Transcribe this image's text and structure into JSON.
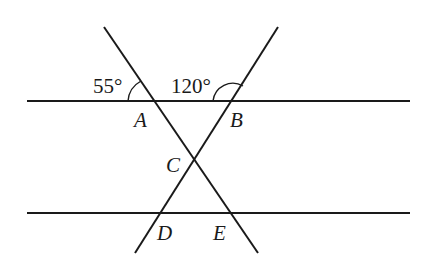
{
  "diagram": {
    "type": "geometry",
    "colors": {
      "stroke": "#1a1a1a",
      "background": "#ffffff"
    },
    "lines": {
      "top_parallel": {
        "x1": 27,
        "y1": 101,
        "x2": 410,
        "y2": 101
      },
      "bottom_parallel": {
        "x1": 27,
        "y1": 213,
        "x2": 410,
        "y2": 213
      },
      "transversal_AE": {
        "x1": 104,
        "y1": 27,
        "x2": 258,
        "y2": 253
      },
      "transversal_BD": {
        "x1": 278,
        "y1": 27,
        "x2": 135,
        "y2": 253
      }
    },
    "points": {
      "A": {
        "label": "A",
        "x": 153,
        "y": 101
      },
      "B": {
        "label": "B",
        "x": 233,
        "y": 101
      },
      "C": {
        "label": "C",
        "x": 194,
        "y": 160
      },
      "D": {
        "label": "D",
        "x": 158,
        "y": 213
      },
      "E": {
        "label": "E",
        "x": 231,
        "y": 213
      }
    },
    "angles": {
      "angle_at_A": {
        "label": "55°",
        "value": 55
      },
      "angle_at_B": {
        "label": "120°",
        "value": 120
      }
    }
  }
}
